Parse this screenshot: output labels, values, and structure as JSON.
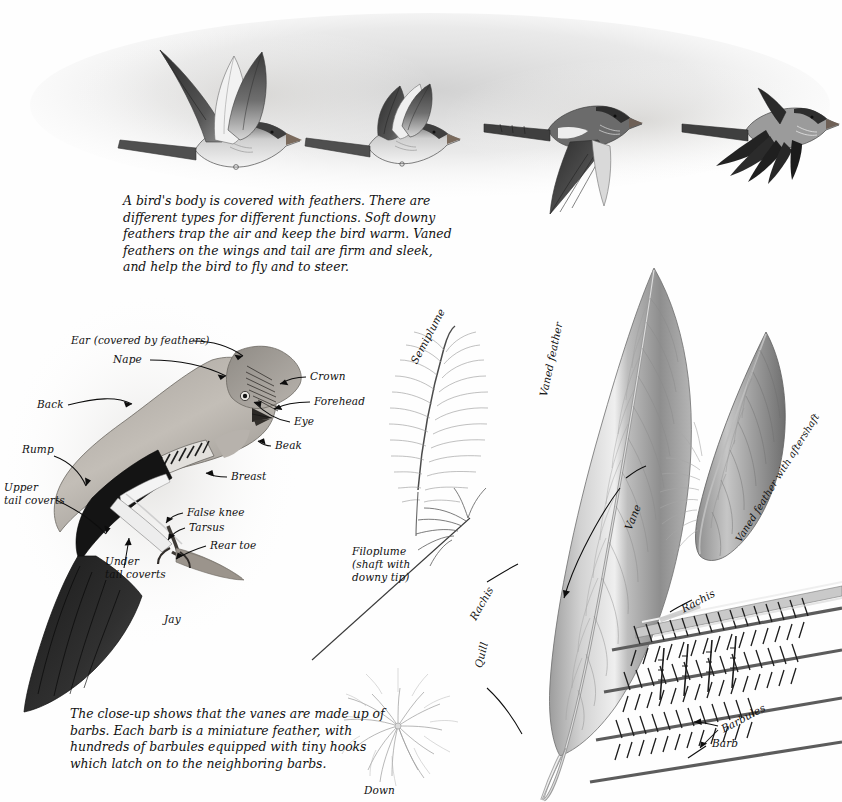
{
  "page": {
    "background_color": "#fefefe",
    "ink_color": "#101010"
  },
  "top_panel": {
    "name": "flying-bird-sequence",
    "bird_count": 4,
    "caption": "A bird's body is covered with feathers. There are different types for different functions. Soft downy feathers trap the air and keep the bird warm. Vaned feathers on the wings and tail are firm and sleek, and help the bird to fly and to steer."
  },
  "bird_panel": {
    "name": "jay-anatomy",
    "subject_label": "Jay",
    "labels": [
      {
        "id": "ear",
        "text": "Ear (covered by feathers)"
      },
      {
        "id": "nape",
        "text": "Nape"
      },
      {
        "id": "back",
        "text": "Back"
      },
      {
        "id": "rump",
        "text": "Rump"
      },
      {
        "id": "upper-tail-coverts",
        "text": "Upper\ntail coverts"
      },
      {
        "id": "under-tail-coverts",
        "text": "Under\ntail coverts"
      },
      {
        "id": "crown",
        "text": "Crown"
      },
      {
        "id": "forehead",
        "text": "Forehead"
      },
      {
        "id": "eye",
        "text": "Eye"
      },
      {
        "id": "beak",
        "text": "Beak"
      },
      {
        "id": "breast",
        "text": "Breast"
      },
      {
        "id": "false-knee",
        "text": "False knee"
      },
      {
        "id": "tarsus",
        "text": "Tarsus"
      },
      {
        "id": "rear-toe",
        "text": "Rear toe"
      }
    ]
  },
  "feather_panel": {
    "name": "feather-types",
    "labels": [
      {
        "id": "semiplume",
        "text": "Semiplume"
      },
      {
        "id": "vaned-feather",
        "text": "Vaned feather"
      },
      {
        "id": "vaned-aftershaft",
        "text": "Vaned feather with aftershaft"
      },
      {
        "id": "filoplume",
        "text": "Filoplume\n(shaft with\ndowny tip)"
      },
      {
        "id": "rachis-main",
        "text": "Rachis"
      },
      {
        "id": "quill",
        "text": "Quill"
      },
      {
        "id": "vane",
        "text": "Vane"
      },
      {
        "id": "down",
        "text": "Down"
      }
    ]
  },
  "closeup_panel": {
    "name": "barb-closeup",
    "labels": [
      {
        "id": "rachis-closeup",
        "text": "Rachis"
      },
      {
        "id": "barbules",
        "text": "Barbules"
      },
      {
        "id": "barb",
        "text": "Barb"
      }
    ],
    "caption": "The close-up shows that the vanes are made up of barbs. Each barb is a miniature feather, with hundreds of barbules equipped with tiny hooks which latch on to the neighboring barbs."
  }
}
